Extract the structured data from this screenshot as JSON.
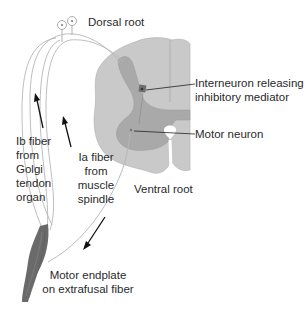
{
  "labels": {
    "dorsal_root": "Dorsal root",
    "interneuron_line1": "Interneuron releasing",
    "interneuron_line2": "inhibitory mediator",
    "motor_neuron": "Motor neuron",
    "ventral_root": "Ventral root",
    "ib_fiber": [
      "Ib fiber",
      "from",
      "Golgi",
      "tendon",
      "organ"
    ],
    "ia_fiber": [
      "Ia fiber",
      "from",
      "muscle",
      "spindle"
    ],
    "motor_endplate_line1": "Motor endplate",
    "motor_endplate_line2": "on extrafusal fiber"
  },
  "colors": {
    "white_matter": "#c9c9c9",
    "gray_matter": "#a9a9a9",
    "interneuron": "#6e6e6e",
    "muscle": "#6a6a6a",
    "fiber_stroke": "#b5b5b5",
    "arrow": "#111111",
    "text": "#2a2a2a"
  }
}
